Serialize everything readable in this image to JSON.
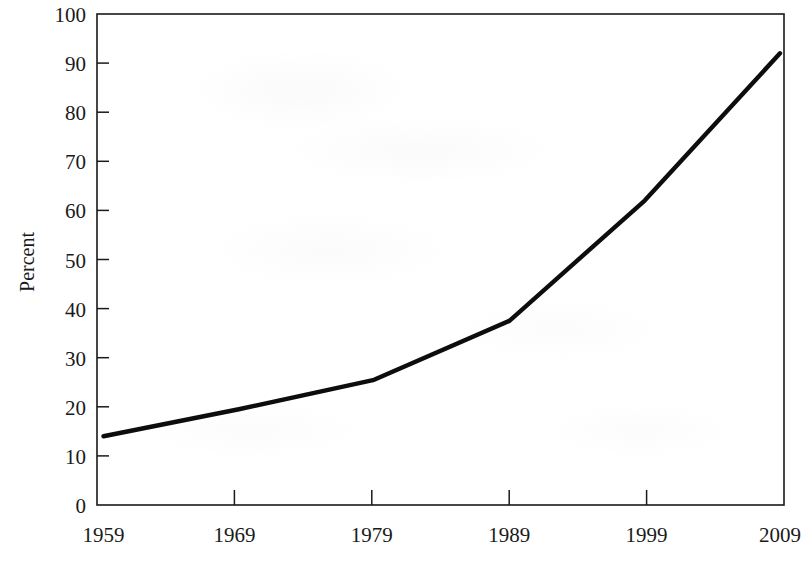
{
  "chart_data": {
    "type": "line",
    "title": "",
    "subtitle": "",
    "xlabel": "",
    "ylabel": "Percent",
    "x": [
      1959,
      1969,
      1979,
      1989,
      1999,
      2009
    ],
    "categories": [
      "1959",
      "1969",
      "1979",
      "1989",
      "1999",
      "2009"
    ],
    "values": [
      14,
      19.5,
      25.5,
      37.5,
      62,
      92
    ],
    "series": [
      {
        "name": "Percent",
        "values": [
          14,
          19.5,
          25.5,
          37.5,
          62,
          92
        ]
      }
    ],
    "xlim": [
      1959,
      2009
    ],
    "ylim": [
      0,
      100
    ],
    "y_ticks": [
      0,
      10,
      20,
      30,
      40,
      50,
      60,
      70,
      80,
      90,
      100
    ],
    "y_tick_labels": [
      "0",
      "10",
      "20",
      "30",
      "40",
      "50",
      "60",
      "70",
      "80",
      "90",
      "100"
    ],
    "x_ticks": [
      1959,
      1969,
      1979,
      1989,
      1999,
      2009
    ],
    "x_tick_labels": [
      "1959",
      "1969",
      "1979",
      "1989",
      "1999",
      "2009"
    ],
    "grid": false,
    "legend": false,
    "legend_position": "none",
    "line_color": "#0d0d0d",
    "axis_color": "#1a1a1a",
    "background_color": "#ffffff",
    "frame": "box",
    "tick_direction": "in",
    "annotations": []
  },
  "axes": {
    "y_title": "Percent",
    "y_labels": {
      "t100": "100",
      "t90": "90",
      "t80": "80",
      "t70": "70",
      "t60": "60",
      "t50": "50",
      "t40": "40",
      "t30": "30",
      "t20": "20",
      "t10": "10",
      "t0": "0"
    },
    "x_labels": {
      "t1959": "1959",
      "t1969": "1969",
      "t1979": "1979",
      "t1989": "1989",
      "t1999": "1999",
      "t2009": "2009"
    }
  }
}
